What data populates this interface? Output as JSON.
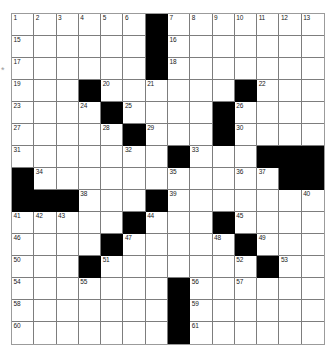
{
  "puzzle": {
    "type": "crossword-grid",
    "columns": 14,
    "rows": 15,
    "marker": "*",
    "colors": {
      "block": "#000000",
      "grid_line": "#7d7d7d",
      "border": "#9b9b9b",
      "background": "#ffffff",
      "number": "#1a1a1a"
    },
    "grid": [
      [
        {
          "num": "1",
          "block": false
        },
        {
          "num": "2",
          "block": false
        },
        {
          "num": "3",
          "block": false
        },
        {
          "num": "4",
          "block": false
        },
        {
          "num": "5",
          "block": false
        },
        {
          "num": "6",
          "block": false
        },
        {
          "num": "",
          "block": true
        },
        {
          "num": "7",
          "block": false
        },
        {
          "num": "8",
          "block": false
        },
        {
          "num": "9",
          "block": false
        },
        {
          "num": "10",
          "block": false
        },
        {
          "num": "11",
          "block": false
        },
        {
          "num": "12",
          "block": false
        },
        {
          "num": "13",
          "block": false
        }
      ],
      [
        {
          "num": "15",
          "block": false
        },
        {
          "num": "",
          "block": false
        },
        {
          "num": "",
          "block": false
        },
        {
          "num": "",
          "block": false
        },
        {
          "num": "",
          "block": false
        },
        {
          "num": "",
          "block": false
        },
        {
          "num": "",
          "block": true
        },
        {
          "num": "16",
          "block": false
        },
        {
          "num": "",
          "block": false
        },
        {
          "num": "",
          "block": false
        },
        {
          "num": "",
          "block": false
        },
        {
          "num": "",
          "block": false
        },
        {
          "num": "",
          "block": false
        },
        {
          "num": "",
          "block": false
        }
      ],
      [
        {
          "num": "17",
          "block": false
        },
        {
          "num": "",
          "block": false
        },
        {
          "num": "",
          "block": false
        },
        {
          "num": "",
          "block": false
        },
        {
          "num": "",
          "block": false
        },
        {
          "num": "",
          "block": false
        },
        {
          "num": "",
          "block": true
        },
        {
          "num": "18",
          "block": false
        },
        {
          "num": "",
          "block": false
        },
        {
          "num": "",
          "block": false
        },
        {
          "num": "",
          "block": false
        },
        {
          "num": "",
          "block": false
        },
        {
          "num": "",
          "block": false
        },
        {
          "num": "",
          "block": false
        }
      ],
      [
        {
          "num": "19",
          "block": false
        },
        {
          "num": "",
          "block": false
        },
        {
          "num": "",
          "block": false
        },
        {
          "num": "",
          "block": true
        },
        {
          "num": "20",
          "block": false
        },
        {
          "num": "",
          "block": false
        },
        {
          "num": "21",
          "block": false
        },
        {
          "num": "",
          "block": false
        },
        {
          "num": "",
          "block": false
        },
        {
          "num": "",
          "block": false
        },
        {
          "num": "",
          "block": true
        },
        {
          "num": "22",
          "block": false
        },
        {
          "num": "",
          "block": false
        },
        {
          "num": "",
          "block": false
        }
      ],
      [
        {
          "num": "23",
          "block": false
        },
        {
          "num": "",
          "block": false
        },
        {
          "num": "",
          "block": false
        },
        {
          "num": "24",
          "block": false
        },
        {
          "num": "",
          "block": true
        },
        {
          "num": "25",
          "block": false
        },
        {
          "num": "",
          "block": false
        },
        {
          "num": "",
          "block": false
        },
        {
          "num": "",
          "block": false
        },
        {
          "num": "",
          "block": true
        },
        {
          "num": "26",
          "block": false
        },
        {
          "num": "",
          "block": false
        },
        {
          "num": "",
          "block": false
        },
        {
          "num": "",
          "block": false
        }
      ],
      [
        {
          "num": "27",
          "block": false
        },
        {
          "num": "",
          "block": false
        },
        {
          "num": "",
          "block": false
        },
        {
          "num": "",
          "block": false
        },
        {
          "num": "28",
          "block": false
        },
        {
          "num": "",
          "block": true
        },
        {
          "num": "29",
          "block": false
        },
        {
          "num": "",
          "block": false
        },
        {
          "num": "",
          "block": false
        },
        {
          "num": "",
          "block": true
        },
        {
          "num": "30",
          "block": false
        },
        {
          "num": "",
          "block": false
        },
        {
          "num": "",
          "block": false
        },
        {
          "num": "",
          "block": false
        }
      ],
      [
        {
          "num": "31",
          "block": false
        },
        {
          "num": "",
          "block": false
        },
        {
          "num": "",
          "block": false
        },
        {
          "num": "",
          "block": false
        },
        {
          "num": "",
          "block": false
        },
        {
          "num": "32",
          "block": false
        },
        {
          "num": "",
          "block": false
        },
        {
          "num": "",
          "block": true
        },
        {
          "num": "33",
          "block": false
        },
        {
          "num": "",
          "block": false
        },
        {
          "num": "",
          "block": false
        },
        {
          "num": "",
          "block": true
        },
        {
          "num": "",
          "block": true
        },
        {
          "num": "",
          "block": true
        }
      ],
      [
        {
          "num": "",
          "block": true
        },
        {
          "num": "34",
          "block": false
        },
        {
          "num": "",
          "block": false
        },
        {
          "num": "",
          "block": false
        },
        {
          "num": "",
          "block": false
        },
        {
          "num": "",
          "block": false
        },
        {
          "num": "",
          "block": false
        },
        {
          "num": "35",
          "block": false
        },
        {
          "num": "",
          "block": false
        },
        {
          "num": "",
          "block": false
        },
        {
          "num": "36",
          "block": false
        },
        {
          "num": "37",
          "block": false
        },
        {
          "num": "",
          "block": true
        },
        {
          "num": "",
          "block": true
        }
      ],
      [
        {
          "num": "",
          "block": true
        },
        {
          "num": "",
          "block": true
        },
        {
          "num": "",
          "block": true
        },
        {
          "num": "38",
          "block": false
        },
        {
          "num": "",
          "block": false
        },
        {
          "num": "",
          "block": false
        },
        {
          "num": "",
          "block": true
        },
        {
          "num": "39",
          "block": false
        },
        {
          "num": "",
          "block": false
        },
        {
          "num": "",
          "block": false
        },
        {
          "num": "",
          "block": false
        },
        {
          "num": "",
          "block": false
        },
        {
          "num": "",
          "block": false
        },
        {
          "num": "40",
          "block": false
        }
      ],
      [
        {
          "num": "41",
          "block": false
        },
        {
          "num": "42",
          "block": false
        },
        {
          "num": "43",
          "block": false
        },
        {
          "num": "",
          "block": false
        },
        {
          "num": "",
          "block": false
        },
        {
          "num": "",
          "block": true
        },
        {
          "num": "44",
          "block": false
        },
        {
          "num": "",
          "block": false
        },
        {
          "num": "",
          "block": false
        },
        {
          "num": "",
          "block": true
        },
        {
          "num": "45",
          "block": false
        },
        {
          "num": "",
          "block": false
        },
        {
          "num": "",
          "block": false
        },
        {
          "num": "",
          "block": false
        }
      ],
      [
        {
          "num": "46",
          "block": false
        },
        {
          "num": "",
          "block": false
        },
        {
          "num": "",
          "block": false
        },
        {
          "num": "",
          "block": false
        },
        {
          "num": "",
          "block": true
        },
        {
          "num": "47",
          "block": false
        },
        {
          "num": "",
          "block": false
        },
        {
          "num": "",
          "block": false
        },
        {
          "num": "",
          "block": false
        },
        {
          "num": "48",
          "block": false
        },
        {
          "num": "",
          "block": true
        },
        {
          "num": "49",
          "block": false
        },
        {
          "num": "",
          "block": false
        },
        {
          "num": "",
          "block": false
        }
      ],
      [
        {
          "num": "50",
          "block": false
        },
        {
          "num": "",
          "block": false
        },
        {
          "num": "",
          "block": false
        },
        {
          "num": "",
          "block": true
        },
        {
          "num": "51",
          "block": false
        },
        {
          "num": "",
          "block": false
        },
        {
          "num": "",
          "block": false
        },
        {
          "num": "",
          "block": false
        },
        {
          "num": "",
          "block": false
        },
        {
          "num": "",
          "block": false
        },
        {
          "num": "52",
          "block": false
        },
        {
          "num": "",
          "block": true
        },
        {
          "num": "53",
          "block": false
        },
        {
          "num": "",
          "block": false
        }
      ],
      [
        {
          "num": "54",
          "block": false
        },
        {
          "num": "",
          "block": false
        },
        {
          "num": "",
          "block": false
        },
        {
          "num": "55",
          "block": false
        },
        {
          "num": "",
          "block": false
        },
        {
          "num": "",
          "block": false
        },
        {
          "num": "",
          "block": false
        },
        {
          "num": "",
          "block": true
        },
        {
          "num": "56",
          "block": false
        },
        {
          "num": "",
          "block": false
        },
        {
          "num": "57",
          "block": false
        },
        {
          "num": "",
          "block": false
        },
        {
          "num": "",
          "block": false
        },
        {
          "num": "",
          "block": false
        }
      ],
      [
        {
          "num": "58",
          "block": false
        },
        {
          "num": "",
          "block": false
        },
        {
          "num": "",
          "block": false
        },
        {
          "num": "",
          "block": false
        },
        {
          "num": "",
          "block": false
        },
        {
          "num": "",
          "block": false
        },
        {
          "num": "",
          "block": false
        },
        {
          "num": "",
          "block": true
        },
        {
          "num": "59",
          "block": false
        },
        {
          "num": "",
          "block": false
        },
        {
          "num": "",
          "block": false
        },
        {
          "num": "",
          "block": false
        },
        {
          "num": "",
          "block": false
        },
        {
          "num": "",
          "block": false
        }
      ],
      [
        {
          "num": "60",
          "block": false
        },
        {
          "num": "",
          "block": false
        },
        {
          "num": "",
          "block": false
        },
        {
          "num": "",
          "block": false
        },
        {
          "num": "",
          "block": false
        },
        {
          "num": "",
          "block": false
        },
        {
          "num": "",
          "block": false
        },
        {
          "num": "",
          "block": true
        },
        {
          "num": "61",
          "block": false
        },
        {
          "num": "",
          "block": false
        },
        {
          "num": "",
          "block": false
        },
        {
          "num": "",
          "block": false
        },
        {
          "num": "",
          "block": false
        },
        {
          "num": "",
          "block": false
        }
      ]
    ],
    "extra_numbers": {
      "row0_col13_trailing": "14"
    }
  }
}
